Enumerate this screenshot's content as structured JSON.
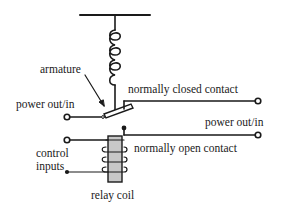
{
  "diagram": {
    "type": "relay schematic",
    "labels": {
      "armature": "armature",
      "normally_closed_contact": "normally closed contact",
      "power_left": "power out/in",
      "power_right": "power out/in",
      "normally_open_contact": "normally open contact",
      "control_inputs_line1": "control",
      "control_inputs_line2": "inputs",
      "relay_coil": "relay coil"
    },
    "components": [
      "spring",
      "armature",
      "normally closed contact",
      "normally open contact",
      "relay coil",
      "control input terminals",
      "power terminals"
    ],
    "colors": {
      "line": "#1a1a1a",
      "coil_fill": "#c8c8c8",
      "background": "#ffffff"
    }
  }
}
